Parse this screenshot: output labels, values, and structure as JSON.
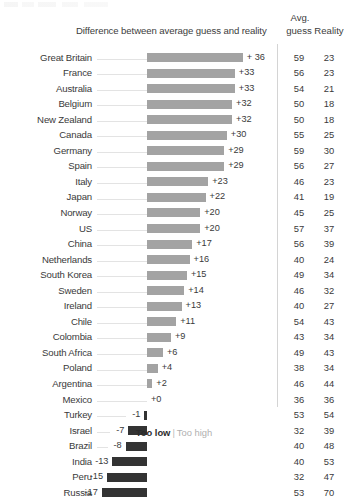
{
  "header": {
    "diff_title": "Difference between average guess and reality",
    "avg_label": "Avg.",
    "guess_label": "guess",
    "reality_label": "Reality"
  },
  "legend": {
    "too_low": "Too low",
    "separator": "|",
    "too_high": "Too high"
  },
  "colors": {
    "positive_bar": "#a3a3a3",
    "negative_bar": "#333333",
    "leader_line": "#e3e3e3",
    "divider": "#d4d4d4",
    "text": "#3a3a3a",
    "too_high_text": "#b0b0b0"
  },
  "chart_data": {
    "type": "bar",
    "title": "Difference between average guess and reality",
    "xlabel": "",
    "ylabel": "",
    "orientation": "horizontal",
    "grid": false,
    "legend_position": "bottom",
    "legend_entries": [
      "Too low",
      "Too high"
    ],
    "axis_zero": 0,
    "value_range": [
      -17,
      36
    ],
    "columns": [
      "Country",
      "Difference",
      "Avg. guess",
      "Reality"
    ],
    "categories": [
      "Great Britain",
      "France",
      "Australia",
      "Belgium",
      "New Zealand",
      "Canada",
      "Germany",
      "Spain",
      "Italy",
      "Japan",
      "Norway",
      "US",
      "China",
      "Netherlands",
      "South Korea",
      "Sweden",
      "Ireland",
      "Chile",
      "Colombia",
      "South Africa",
      "Poland",
      "Argentina",
      "Mexico",
      "Turkey",
      "Israel",
      "Brazil",
      "India",
      "Peru",
      "Russia"
    ],
    "values": [
      36,
      33,
      33,
      32,
      32,
      30,
      29,
      29,
      23,
      22,
      20,
      20,
      17,
      16,
      15,
      14,
      13,
      11,
      9,
      6,
      4,
      2,
      0,
      -1,
      -7,
      -8,
      -13,
      -15,
      -17
    ],
    "value_labels": [
      "+ 36",
      "+33",
      "+33",
      "+32",
      "+32",
      "+30",
      "+29",
      "+29",
      "+23",
      "+22",
      "+20",
      "+20",
      "+17",
      "+16",
      "+15",
      "+14",
      "+13",
      "+11",
      "+9",
      "+6",
      "+4",
      "+2",
      "+0",
      "-1",
      "-7",
      "-8",
      "-13",
      "-15",
      "-17"
    ],
    "series": [
      {
        "name": "Avg. guess",
        "values": [
          59,
          56,
          54,
          50,
          50,
          55,
          59,
          56,
          46,
          41,
          45,
          57,
          56,
          40,
          49,
          46,
          40,
          54,
          43,
          49,
          38,
          46,
          36,
          53,
          32,
          40,
          40,
          32,
          53
        ]
      },
      {
        "name": "Reality",
        "values": [
          23,
          23,
          21,
          18,
          18,
          25,
          30,
          27,
          23,
          19,
          25,
          37,
          39,
          24,
          34,
          32,
          27,
          43,
          34,
          43,
          34,
          44,
          36,
          54,
          39,
          48,
          53,
          47,
          70
        ]
      }
    ]
  },
  "rows": [
    {
      "country": "Great Britain",
      "diff": 36,
      "diff_label": "+ 36",
      "guess": "59",
      "reality": "23"
    },
    {
      "country": "France",
      "diff": 33,
      "diff_label": "+33",
      "guess": "56",
      "reality": "23"
    },
    {
      "country": "Australia",
      "diff": 33,
      "diff_label": "+33",
      "guess": "54",
      "reality": "21"
    },
    {
      "country": "Belgium",
      "diff": 32,
      "diff_label": "+32",
      "guess": "50",
      "reality": "18"
    },
    {
      "country": "New Zealand",
      "diff": 32,
      "diff_label": "+32",
      "guess": "50",
      "reality": "18"
    },
    {
      "country": "Canada",
      "diff": 30,
      "diff_label": "+30",
      "guess": "55",
      "reality": "25"
    },
    {
      "country": "Germany",
      "diff": 29,
      "diff_label": "+29",
      "guess": "59",
      "reality": "30"
    },
    {
      "country": "Spain",
      "diff": 29,
      "diff_label": "+29",
      "guess": "56",
      "reality": "27"
    },
    {
      "country": "Italy",
      "diff": 23,
      "diff_label": "+23",
      "guess": "46",
      "reality": "23"
    },
    {
      "country": "Japan",
      "diff": 22,
      "diff_label": "+22",
      "guess": "41",
      "reality": "19"
    },
    {
      "country": "Norway",
      "diff": 20,
      "diff_label": "+20",
      "guess": "45",
      "reality": "25"
    },
    {
      "country": "US",
      "diff": 20,
      "diff_label": "+20",
      "guess": "57",
      "reality": "37"
    },
    {
      "country": "China",
      "diff": 17,
      "diff_label": "+17",
      "guess": "56",
      "reality": "39"
    },
    {
      "country": "Netherlands",
      "diff": 16,
      "diff_label": "+16",
      "guess": "40",
      "reality": "24"
    },
    {
      "country": "South Korea",
      "diff": 15,
      "diff_label": "+15",
      "guess": "49",
      "reality": "34"
    },
    {
      "country": "Sweden",
      "diff": 14,
      "diff_label": "+14",
      "guess": "46",
      "reality": "32"
    },
    {
      "country": "Ireland",
      "diff": 13,
      "diff_label": "+13",
      "guess": "40",
      "reality": "27"
    },
    {
      "country": "Chile",
      "diff": 11,
      "diff_label": "+11",
      "guess": "54",
      "reality": "43"
    },
    {
      "country": "Colombia",
      "diff": 9,
      "diff_label": "+9",
      "guess": "43",
      "reality": "34"
    },
    {
      "country": "South Africa",
      "diff": 6,
      "diff_label": "+6",
      "guess": "49",
      "reality": "43"
    },
    {
      "country": "Poland",
      "diff": 4,
      "diff_label": "+4",
      "guess": "38",
      "reality": "34"
    },
    {
      "country": "Argentina",
      "diff": 2,
      "diff_label": "+2",
      "guess": "46",
      "reality": "44"
    },
    {
      "country": "Mexico",
      "diff": 0,
      "diff_label": "+0",
      "guess": "36",
      "reality": "36"
    },
    {
      "country": "Turkey",
      "diff": -1,
      "diff_label": "-1",
      "guess": "53",
      "reality": "54"
    },
    {
      "country": "Israel",
      "diff": -7,
      "diff_label": "-7",
      "guess": "32",
      "reality": "39"
    },
    {
      "country": "Brazil",
      "diff": -8,
      "diff_label": "-8",
      "guess": "40",
      "reality": "48"
    },
    {
      "country": "India",
      "diff": -13,
      "diff_label": "-13",
      "guess": "40",
      "reality": "53"
    },
    {
      "country": "Peru",
      "diff": -15,
      "diff_label": "-15",
      "guess": "32",
      "reality": "47"
    },
    {
      "country": "Russia",
      "diff": -17,
      "diff_label": "-17",
      "guess": "53",
      "reality": "70"
    }
  ]
}
